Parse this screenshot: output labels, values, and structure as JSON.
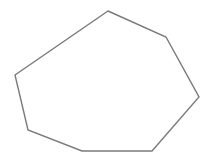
{
  "canvas": {
    "width": 209,
    "height": 160,
    "background": "#ffffff"
  },
  "shape": {
    "type": "heptagon",
    "vertex_count": 7,
    "stroke": "#7a7a7a",
    "stroke_width": 1.4,
    "fill": "none",
    "points": [
      [
        108,
        11
      ],
      [
        166,
        37
      ],
      [
        199,
        97
      ],
      [
        152,
        151
      ],
      [
        82,
        151
      ],
      [
        28,
        130
      ],
      [
        15,
        75
      ]
    ]
  }
}
